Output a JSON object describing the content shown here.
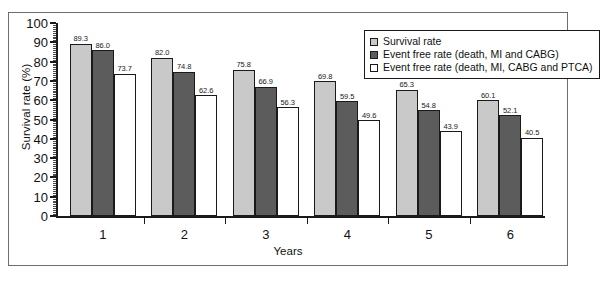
{
  "chart_data": {
    "type": "bar",
    "title": "",
    "xlabel": "Years",
    "ylabel": "Survival rate (%)",
    "categories": [
      "1",
      "2",
      "3",
      "4",
      "5",
      "6"
    ],
    "ylim": [
      0,
      100
    ],
    "ytick_step": 10,
    "yticks": [
      0,
      10,
      20,
      30,
      40,
      50,
      60,
      70,
      80,
      90,
      100
    ],
    "minor_ticks": true,
    "grid": false,
    "legend_position": "top-right",
    "series": [
      {
        "name": "Survival rate",
        "color": "#c9c9c9",
        "values": [
          89.3,
          82.0,
          75.8,
          69.8,
          65.3,
          60.1
        ],
        "labels": [
          "89.3",
          "82.0",
          "75.8",
          "69.8",
          "65.3",
          "60.1"
        ]
      },
      {
        "name": "Event free rate (death, MI and CABG)",
        "color": "#5c5c5c",
        "values": [
          86.0,
          74.8,
          66.9,
          59.5,
          54.8,
          52.1
        ],
        "labels": [
          "86.0",
          "74.8",
          "66.9",
          "59.5",
          "54.8",
          "52.1"
        ]
      },
      {
        "name": "Event free rate (death, MI, CABG and PTCA)",
        "color": "#ffffff",
        "values": [
          73.7,
          62.6,
          56.3,
          49.6,
          43.9,
          40.5
        ],
        "labels": [
          "73.7",
          "62.6",
          "56.3",
          "49.6",
          "43.9",
          "40.5"
        ]
      }
    ]
  },
  "figure": {
    "caption": ""
  }
}
